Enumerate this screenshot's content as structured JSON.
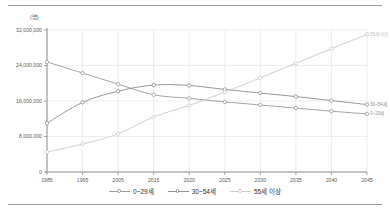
{
  "unit_label": "(명)",
  "legend": {
    "position": "bottom-center",
    "items": [
      {
        "label": "0~29세",
        "color": "#9a9a9a",
        "marker": "circle-open"
      },
      {
        "label": "30~54세",
        "color": "#8d8d8d",
        "marker": "circle-open"
      },
      {
        "label": "55세 이상",
        "color": "#c9c9c9",
        "marker": "circle-open"
      }
    ]
  },
  "annotations": [
    {
      "name": "label-55-plus",
      "text": "55세 이상",
      "x": 2045,
      "y": 31000000,
      "color": "#c2c2c2"
    },
    {
      "name": "label-30-54",
      "text": "30~54세",
      "x": 2045,
      "y": 15200000,
      "color": "#8d8d8d"
    },
    {
      "name": "label-0-29",
      "text": "0~29세",
      "x": 2045,
      "y": 13100000,
      "color": "#9a9a9a"
    }
  ],
  "chart_data": {
    "type": "line",
    "title": "",
    "subtitle": "",
    "xlabel": "",
    "ylabel": "(명)",
    "grid": true,
    "legend_position": "bottom",
    "x": [
      1985,
      1995,
      2005,
      2015,
      2020,
      2025,
      2030,
      2035,
      2040,
      2045
    ],
    "xtick_labels": [
      "1985",
      "1995",
      "2005",
      "2015",
      "2020",
      "2025",
      "2030",
      "2035",
      "2040",
      "2045"
    ],
    "xlim": [
      1985,
      2045
    ],
    "ylim": [
      0,
      32000000
    ],
    "ytick_values": [
      0,
      8000000,
      16000000,
      24000000,
      32000000
    ],
    "ytick_labels": [
      "0",
      "8,000,000",
      "16,000,000",
      "24,000,000",
      "32,000,000"
    ],
    "series": [
      {
        "name": "0~29세",
        "color": "#9a9a9a",
        "values": [
          24800000,
          22300000,
          19800000,
          17400000,
          16600000,
          15800000,
          15100000,
          14400000,
          13700000,
          13100000
        ]
      },
      {
        "name": "30~54세",
        "color": "#8d8d8d",
        "values": [
          11000000,
          15700000,
          18200000,
          19600000,
          19500000,
          18600000,
          17800000,
          17000000,
          16100000,
          15200000
        ]
      },
      {
        "name": "55세 이상",
        "color": "#c9c9c9",
        "values": [
          4500000,
          6300000,
          8600000,
          12400000,
          15000000,
          18000000,
          21200000,
          24500000,
          27800000,
          31000000
        ]
      }
    ]
  }
}
